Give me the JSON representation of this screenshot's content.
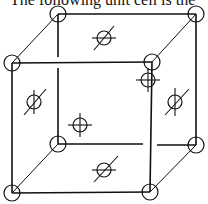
{
  "caption": "The following unit cell is the",
  "diagram": {
    "type": "face-centered cubic unit cell (perspective)",
    "line_color": "#111111",
    "background": "#ffffff",
    "corner_atoms": [
      {
        "name": "back-top-left",
        "x": 58,
        "y": 14
      },
      {
        "name": "back-top-right",
        "x": 196,
        "y": 14
      },
      {
        "name": "front-top-left",
        "x": 12,
        "y": 63
      },
      {
        "name": "front-top-right",
        "x": 152,
        "y": 62
      },
      {
        "name": "back-bottom-left",
        "x": 58,
        "y": 144
      },
      {
        "name": "back-bottom-right",
        "x": 196,
        "y": 145
      },
      {
        "name": "front-bottom-left",
        "x": 12,
        "y": 193
      },
      {
        "name": "front-bottom-right",
        "x": 150,
        "y": 192
      }
    ],
    "face_atoms": [
      {
        "name": "top-face",
        "x": 104,
        "y": 38,
        "symbol": "slashed-circle"
      },
      {
        "name": "left-face",
        "x": 34,
        "y": 102,
        "symbol": "slashed-circle"
      },
      {
        "name": "right-face",
        "x": 175,
        "y": 102,
        "symbol": "slashed-circle"
      },
      {
        "name": "bottom-face",
        "x": 104,
        "y": 170,
        "symbol": "slashed-circle"
      },
      {
        "name": "back-face",
        "x": 148,
        "y": 80,
        "symbol": "crosshair-circle"
      },
      {
        "name": "front-face",
        "x": 80,
        "y": 125,
        "symbol": "crosshair-circle"
      }
    ]
  }
}
